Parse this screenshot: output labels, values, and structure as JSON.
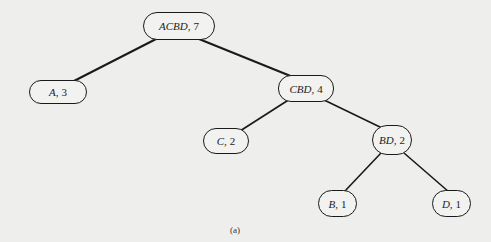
{
  "diagram": {
    "type": "huffman-tree",
    "caption": "(a)",
    "nodes": [
      {
        "id": "root",
        "symbols": "ACBD",
        "weight": "7"
      },
      {
        "id": "a",
        "symbols": "A",
        "weight": "3"
      },
      {
        "id": "cbd",
        "symbols": "CBD",
        "weight": "4"
      },
      {
        "id": "c",
        "symbols": "C",
        "weight": "2"
      },
      {
        "id": "bd",
        "symbols": "BD",
        "weight": "2"
      },
      {
        "id": "b",
        "symbols": "B",
        "weight": "1"
      },
      {
        "id": "d",
        "symbols": "D",
        "weight": "1"
      }
    ],
    "edges": [
      [
        "root",
        "a"
      ],
      [
        "root",
        "cbd"
      ],
      [
        "cbd",
        "c"
      ],
      [
        "cbd",
        "bd"
      ],
      [
        "bd",
        "b"
      ],
      [
        "bd",
        "d"
      ]
    ],
    "colors": {
      "background": "#eeeeec",
      "stroke": "#1a1a1a",
      "text": "#222222"
    }
  }
}
